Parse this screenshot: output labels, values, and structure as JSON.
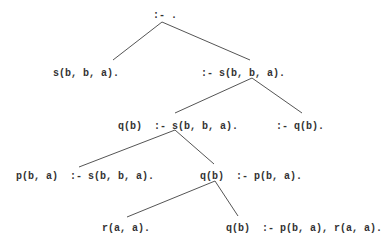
{
  "tree": {
    "title": "Prolog SLD resolution tree",
    "nodes": [
      {
        "id": "root",
        "label": ":- .",
        "x": 153,
        "y": 10
      },
      {
        "id": "n1",
        "label": "s(b, b, a).",
        "x": 53,
        "y": 68
      },
      {
        "id": "n2",
        "label": ":- s(b, b, a).",
        "x": 201,
        "y": 68
      },
      {
        "id": "n3",
        "label": "q(b)  :- s(b, b, a).",
        "x": 118,
        "y": 121
      },
      {
        "id": "n4",
        "label": ":- q(b).",
        "x": 276,
        "y": 121
      },
      {
        "id": "n5",
        "label": "p(b, a)  :- s(b, b, a).",
        "x": 16,
        "y": 171
      },
      {
        "id": "n6",
        "label": "q(b)  :- p(b, a).",
        "x": 200,
        "y": 171
      },
      {
        "id": "n7",
        "label": "r(a, a).",
        "x": 102,
        "y": 223
      },
      {
        "id": "n8",
        "label": "q(b)  :- p(b, a), r(a, a).",
        "x": 226,
        "y": 223
      }
    ],
    "edges": [
      {
        "from": "root",
        "to": "n1",
        "x1": 162,
        "y1": 22,
        "x2": 113,
        "y2": 60
      },
      {
        "from": "root",
        "to": "n2",
        "x1": 162,
        "y1": 22,
        "x2": 250,
        "y2": 60
      },
      {
        "from": "n2",
        "to": "n3",
        "x1": 252,
        "y1": 78,
        "x2": 175,
        "y2": 113
      },
      {
        "from": "n2",
        "to": "n4",
        "x1": 252,
        "y1": 78,
        "x2": 302,
        "y2": 113
      },
      {
        "from": "n3",
        "to": "n5",
        "x1": 175,
        "y1": 130,
        "x2": 79,
        "y2": 167
      },
      {
        "from": "n3",
        "to": "n6",
        "x1": 175,
        "y1": 130,
        "x2": 214,
        "y2": 164
      },
      {
        "from": "n6",
        "to": "n7",
        "x1": 215,
        "y1": 181,
        "x2": 127,
        "y2": 217
      },
      {
        "from": "n6",
        "to": "n8",
        "x1": 215,
        "y1": 181,
        "x2": 238,
        "y2": 216
      }
    ]
  }
}
